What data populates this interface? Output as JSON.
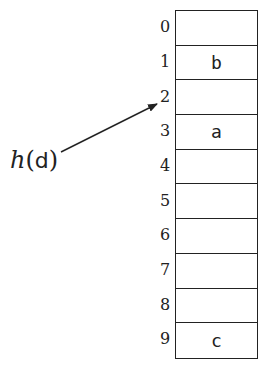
{
  "diagram": {
    "type": "hash-table",
    "label": {
      "function": "h",
      "open_paren": "(",
      "argument": "d",
      "close_paren": ")"
    },
    "arrow_target_index": 2,
    "slots": [
      {
        "index": "0",
        "value": ""
      },
      {
        "index": "1",
        "value": "b"
      },
      {
        "index": "2",
        "value": ""
      },
      {
        "index": "3",
        "value": "a"
      },
      {
        "index": "4",
        "value": ""
      },
      {
        "index": "5",
        "value": ""
      },
      {
        "index": "6",
        "value": ""
      },
      {
        "index": "7",
        "value": ""
      },
      {
        "index": "8",
        "value": ""
      },
      {
        "index": "9",
        "value": "c"
      }
    ]
  }
}
